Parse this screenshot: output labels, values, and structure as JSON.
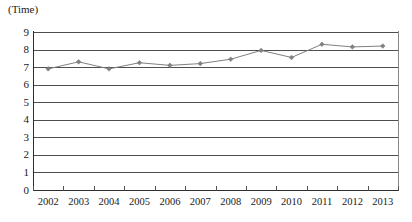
{
  "chart_data": {
    "type": "line",
    "title": "",
    "subtitle": "",
    "unit_caption": "(Time)",
    "xlabel": "",
    "ylabel": "",
    "categories": [
      "2002",
      "2003",
      "2004",
      "2005",
      "2006",
      "2007",
      "2008",
      "2009",
      "2010",
      "2011",
      "2012",
      "2013"
    ],
    "values": [
      6.9,
      7.3,
      6.9,
      7.25,
      7.1,
      7.2,
      7.45,
      7.95,
      7.55,
      8.3,
      8.15,
      8.2
    ],
    "series": [
      {
        "name": "Time",
        "values": [
          6.9,
          7.3,
          6.9,
          7.25,
          7.1,
          7.2,
          7.45,
          7.95,
          7.55,
          8.3,
          8.15,
          8.2
        ]
      }
    ],
    "ylim": [
      0,
      9
    ],
    "y_ticks": [
      9,
      8,
      7,
      6,
      5,
      4,
      3,
      2,
      1,
      0
    ],
    "y_tick_labels": [
      "9",
      "8",
      "7",
      "6",
      "5",
      "4",
      "3",
      "2",
      "1",
      "0"
    ],
    "grid": true,
    "grid_axis": "y",
    "legend": false,
    "legend_position": "none",
    "marker": "diamond",
    "line_color": "#808080",
    "marker_color": "#808080",
    "grid_color": "#4f4f4f",
    "axis_color": "#2d2d2d",
    "background": "#ffffff"
  }
}
